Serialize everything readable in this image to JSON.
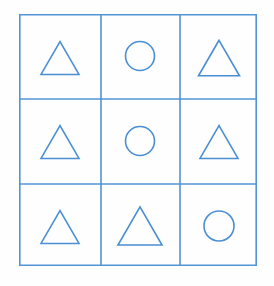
{
  "figure": {
    "background_color": "#fefefe",
    "stroke_color": "#4a8fd4",
    "grid_line_color": "#5294d6",
    "shape_fill": "none",
    "stroke_width": 1.6,
    "grid_stroke_width": 1.6,
    "outer_box": {
      "x": 0,
      "y": 0,
      "width": 238,
      "height": 252
    },
    "columns": 3,
    "rows": 3,
    "column_edges": [
      0,
      82,
      161,
      238
    ],
    "row_edges": [
      0,
      85,
      170,
      252
    ],
    "cells": [
      {
        "row": 1,
        "col": 1,
        "shape": "triangle",
        "label": "triangle",
        "cx": 41,
        "cy": 44,
        "size": 38
      },
      {
        "row": 1,
        "col": 2,
        "shape": "circle",
        "label": "circle",
        "cx": 121,
        "cy": 42,
        "size": 29
      },
      {
        "row": 1,
        "col": 3,
        "shape": "triangle",
        "label": "triangle",
        "cx": 200,
        "cy": 44,
        "size": 41
      },
      {
        "row": 2,
        "col": 1,
        "shape": "triangle",
        "label": "triangle",
        "cx": 41,
        "cy": 128,
        "size": 38
      },
      {
        "row": 2,
        "col": 2,
        "shape": "circle",
        "label": "circle",
        "cx": 121,
        "cy": 127,
        "size": 29
      },
      {
        "row": 2,
        "col": 3,
        "shape": "triangle",
        "label": "triangle",
        "cx": 200,
        "cy": 128,
        "size": 38
      },
      {
        "row": 3,
        "col": 1,
        "shape": "triangle",
        "label": "triangle",
        "cx": 41,
        "cy": 213,
        "size": 38
      },
      {
        "row": 3,
        "col": 2,
        "shape": "triangle",
        "label": "triangle",
        "cx": 121,
        "cy": 212,
        "size": 44
      },
      {
        "row": 3,
        "col": 3,
        "shape": "circle",
        "label": "circle",
        "cx": 200,
        "cy": 212,
        "size": 30
      }
    ]
  }
}
